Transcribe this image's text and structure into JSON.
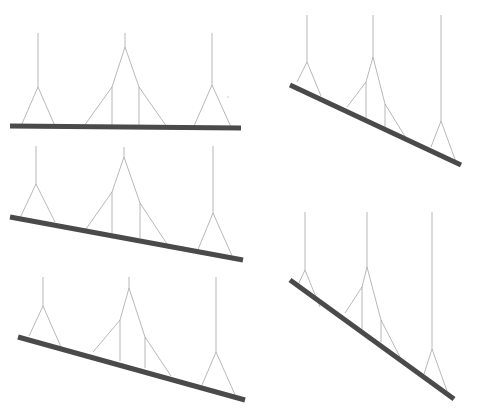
{
  "diagram": {
    "title": "",
    "colors": {
      "background": "#ffffff",
      "beam": "#4a4a4a",
      "cable": "#9a9a9a"
    },
    "beam_width": 5,
    "cable_width": 0.7,
    "panels": [
      {
        "id": "panel-top-left",
        "beam": [
          [
            10,
            126
          ],
          [
            241,
            128
          ]
        ],
        "cables": [
          {
            "name": "left-hanger",
            "top": [
              38,
              33
            ],
            "apex": [
              38,
              87
            ],
            "feet": [
              [
                21,
                126
              ],
              [
                55,
                126
              ]
            ]
          },
          {
            "name": "center-hanger",
            "top": [
              125,
              33
            ],
            "apex": [
              125,
              47
            ],
            "nodes": [
              [
                112,
                87
              ],
              [
                139,
                87
              ]
            ],
            "feet": [
              [
                84,
                126
              ],
              [
                112,
                126
              ],
              [
                139,
                126
              ],
              [
                167,
                127
              ]
            ]
          },
          {
            "name": "right-hanger",
            "top": [
              212,
              33
            ],
            "apex": [
              212,
              85
            ],
            "feet": [
              [
                194,
                126
              ],
              [
                231,
                127
              ]
            ]
          }
        ],
        "marks": [
          [
            228,
            97
          ]
        ]
      },
      {
        "id": "panel-top-right",
        "beam": [
          [
            290,
            85
          ],
          [
            461,
            165
          ]
        ],
        "cables": [
          {
            "name": "left-hanger",
            "top": [
              307,
              15
            ],
            "apex": [
              307,
              62
            ],
            "feet": [
              [
                297,
                82
              ],
              [
                321,
                96
              ]
            ]
          },
          {
            "name": "center-hanger",
            "top": [
              373,
              15
            ],
            "apex": [
              373,
              57
            ],
            "nodes": [
              [
                366,
                82
              ],
              [
                385,
                104
              ]
            ],
            "feet": [
              [
                347,
                107
              ],
              [
                366,
                118
              ],
              [
                385,
                127
              ],
              [
                406,
                138
              ]
            ]
          },
          {
            "name": "right-hanger",
            "top": [
              441,
              15
            ],
            "apex": [
              441,
              121
            ],
            "feet": [
              [
                431,
                147
              ],
              [
                456,
                162
              ]
            ]
          }
        ],
        "marks": []
      },
      {
        "id": "panel-middle-left",
        "beam": [
          [
            10,
            217
          ],
          [
            243,
            260
          ]
        ],
        "cables": [
          {
            "name": "left-hanger",
            "top": [
              36,
              146
            ],
            "apex": [
              36,
              184
            ],
            "feet": [
              [
                20,
                218
              ],
              [
                55,
                222
              ]
            ]
          },
          {
            "name": "center-hanger",
            "top": [
              124,
              147
            ],
            "apex": [
              124,
              157
            ],
            "nodes": [
              [
                112,
                192
              ],
              [
                140,
                203
              ]
            ],
            "feet": [
              [
                86,
                229
              ],
              [
                112,
                233
              ],
              [
                140,
                238
              ],
              [
                167,
                244
              ]
            ]
          },
          {
            "name": "right-hanger",
            "top": [
              213,
              146
            ],
            "apex": [
              213,
              213
            ],
            "feet": [
              [
                197,
                252
              ],
              [
                233,
                258
              ]
            ]
          }
        ],
        "marks": []
      },
      {
        "id": "panel-bottom-left",
        "beam": [
          [
            18,
            337
          ],
          [
            245,
            400
          ]
        ],
        "cables": [
          {
            "name": "left-hanger",
            "top": [
              43,
              277
            ],
            "apex": [
              43,
              306
            ],
            "feet": [
              [
                29,
                336
              ],
              [
                61,
                347
              ]
            ]
          },
          {
            "name": "center-hanger",
            "top": [
              129,
              277
            ],
            "apex": [
              129,
              288
            ],
            "nodes": [
              [
                120,
                320
              ],
              [
                145,
                337
              ]
            ],
            "feet": [
              [
                93,
                352
              ],
              [
                120,
                361
              ],
              [
                145,
                368
              ],
              [
                171,
                376
              ]
            ]
          },
          {
            "name": "right-hanger",
            "top": [
              216,
              277
            ],
            "apex": [
              216,
              352
            ],
            "feet": [
              [
                202,
                385
              ],
              [
                236,
                397
              ]
            ]
          }
        ],
        "marks": []
      },
      {
        "id": "panel-bottom-right",
        "beam": [
          [
            290,
            280
          ],
          [
            454,
            399
          ]
        ],
        "cables": [
          {
            "name": "left-hanger",
            "top": [
              305,
              212
            ],
            "apex": [
              305,
              270
            ],
            "feet": [
              [
                297,
                287
              ],
              [
                320,
                307
              ]
            ]
          },
          {
            "name": "center-hanger",
            "top": [
              367,
              212
            ],
            "apex": [
              367,
              267
            ],
            "nodes": [
              [
                362,
                287
              ],
              [
                381,
                320
              ]
            ],
            "feet": [
              [
                345,
                313
              ],
              [
                362,
                329
              ],
              [
                381,
                342
              ],
              [
                400,
                357
              ]
            ]
          },
          {
            "name": "right-hanger",
            "top": [
              432,
              212
            ],
            "apex": [
              432,
              349
            ],
            "feet": [
              [
                424,
                374
              ],
              [
                447,
                391
              ]
            ]
          }
        ],
        "marks": []
      }
    ]
  }
}
